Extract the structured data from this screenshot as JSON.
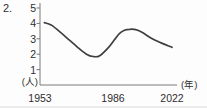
{
  "page": {
    "item_number": "2."
  },
  "chart_data": {
    "type": "line",
    "title": "",
    "xlabel": "(年)",
    "ylabel": "(人)",
    "grid": false,
    "legend": "none",
    "y_axis": {
      "unit_label": "(人)",
      "range": [
        0,
        5
      ],
      "ticks": [
        "5",
        "4",
        "3",
        "2",
        "1"
      ],
      "tick_values": [
        5,
        4,
        3,
        2,
        1
      ]
    },
    "x_axis": {
      "unit_label": "(年)",
      "ticks": [
        {
          "label": "1953",
          "year": 1953
        },
        {
          "label": "1986",
          "year": 1986
        },
        {
          "label": "2022",
          "year": 2022
        }
      ]
    },
    "series": [
      {
        "name": "persons-per-year-curve",
        "color": "#3f3f3f",
        "points": [
          [
            1955,
            4.05
          ],
          [
            1958,
            3.9
          ],
          [
            1962,
            3.45
          ],
          [
            1966,
            2.95
          ],
          [
            1970,
            2.45
          ],
          [
            1974,
            2.0
          ],
          [
            1977,
            1.85
          ],
          [
            1980,
            1.9
          ],
          [
            1984,
            2.45
          ],
          [
            1987,
            2.95
          ],
          [
            1990,
            3.35
          ],
          [
            1993,
            3.55
          ],
          [
            1996,
            3.62
          ],
          [
            2000,
            3.6
          ],
          [
            2004,
            3.4
          ],
          [
            2010,
            3.0
          ],
          [
            2016,
            2.7
          ],
          [
            2022,
            2.45
          ]
        ]
      }
    ],
    "axis_color": "#7a7a7a"
  }
}
